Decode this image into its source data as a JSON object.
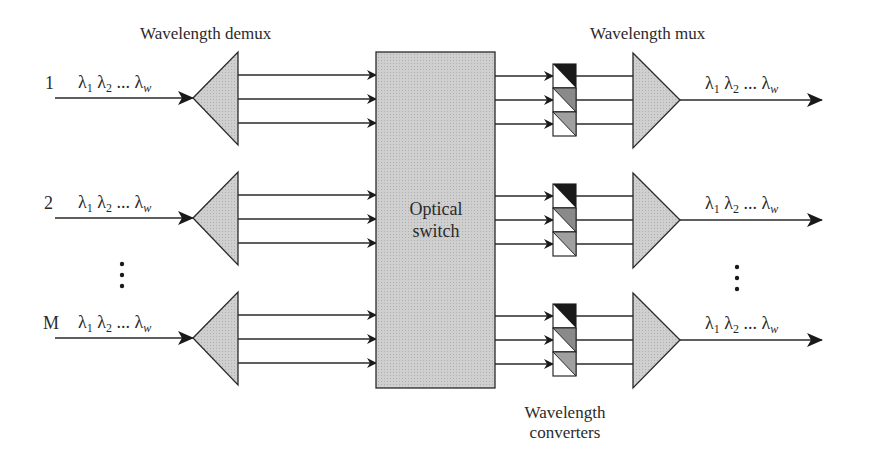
{
  "labels": {
    "demux": "Wavelength demux",
    "mux": "Wavelength mux",
    "switch_line1": "Optical",
    "switch_line2": "switch",
    "converters_line1": "Wavelength",
    "converters_line2": "converters"
  },
  "inputs": [
    {
      "id": "1",
      "lambda1": "λ",
      "sub1": "1",
      "lambda2": "λ",
      "sub2": "2",
      "ellipsis": "...",
      "lambdaw": "λ",
      "subw": "w"
    },
    {
      "id": "2",
      "lambda1": "λ",
      "sub1": "1",
      "lambda2": "λ",
      "sub2": "2",
      "ellipsis": "...",
      "lambdaw": "λ",
      "subw": "w"
    },
    {
      "id": "M",
      "lambda1": "λ",
      "sub1": "1",
      "lambda2": "λ",
      "sub2": "2",
      "ellipsis": "...",
      "lambdaw": "λ",
      "subw": "w"
    }
  ],
  "outputs": [
    {
      "lambda1": "λ",
      "sub1": "1",
      "lambda2": "λ",
      "sub2": "2",
      "ellipsis": "...",
      "lambdaw": "λ",
      "subw": "w"
    },
    {
      "lambda1": "λ",
      "sub1": "1",
      "lambda2": "λ",
      "sub2": "2",
      "ellipsis": "...",
      "lambdaw": "λ",
      "subw": "w"
    },
    {
      "lambda1": "λ",
      "sub1": "1",
      "lambda2": "λ",
      "sub2": "2",
      "ellipsis": "...",
      "lambdaw": "λ",
      "subw": "w"
    }
  ],
  "vdots": "⋮",
  "colors": {
    "fill_gray": "#c8c8c8",
    "converter_dark": "#1a1a1a",
    "converter_mid": "#8a8a8a",
    "stroke": "#2a2a2a"
  }
}
